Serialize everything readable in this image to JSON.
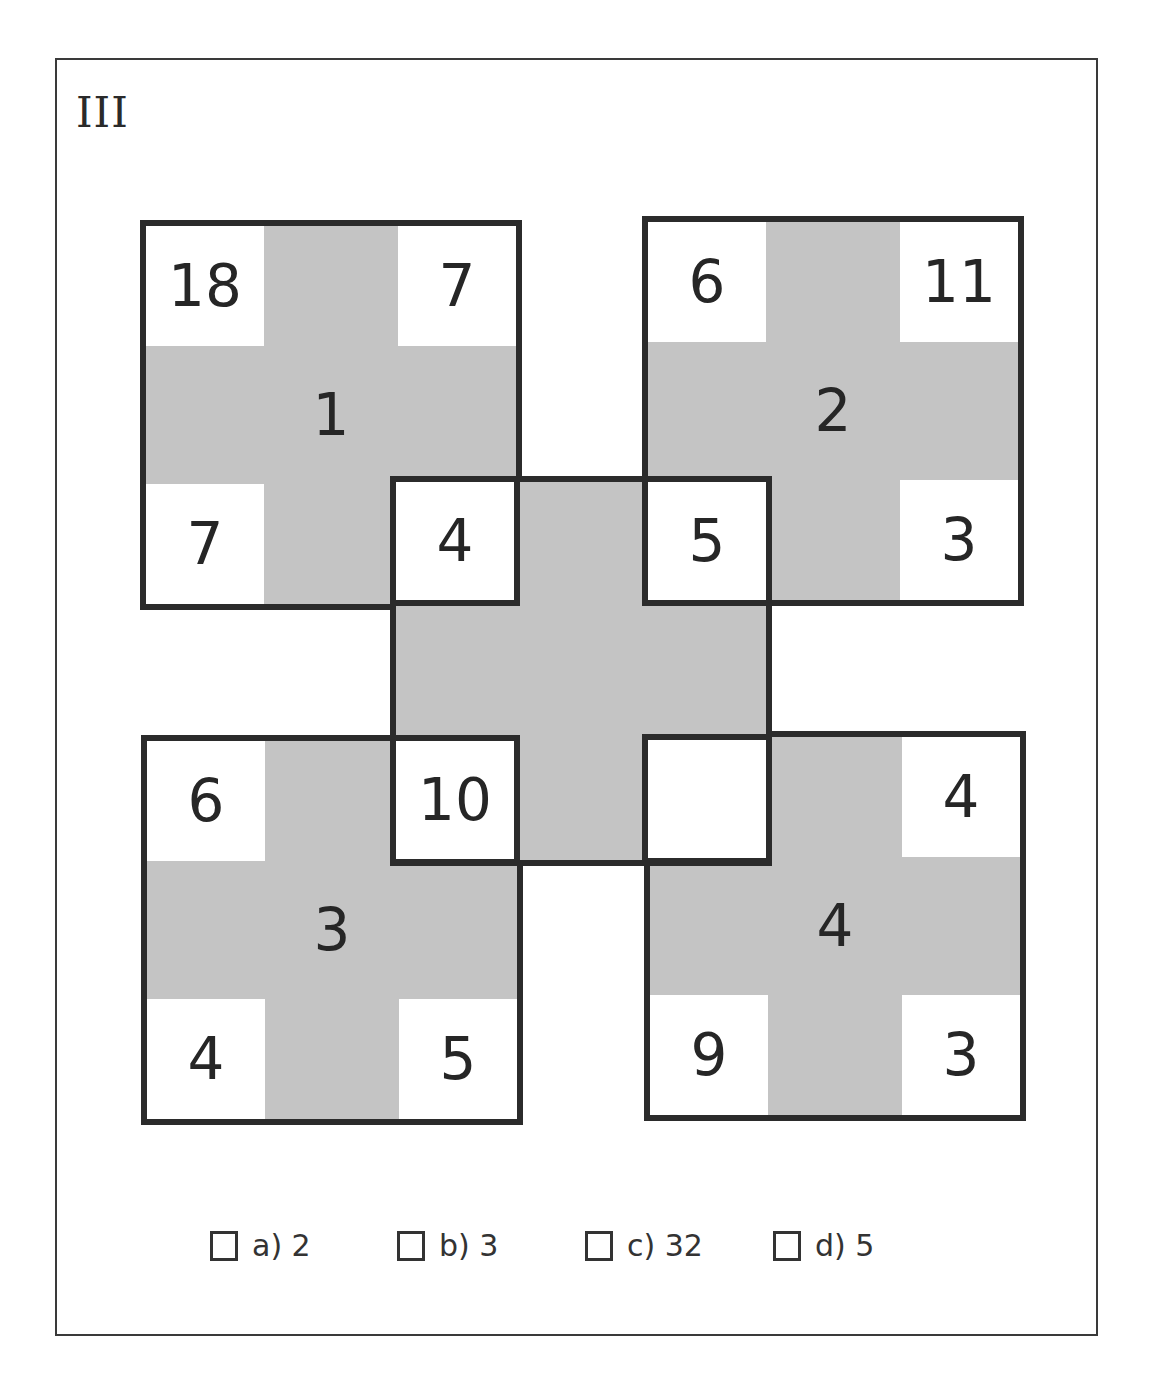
{
  "puzzle": {
    "label": "III",
    "squares": [
      {
        "id": 1,
        "center": "1",
        "top_left": "18",
        "top_right": "7",
        "bottom_left": "7",
        "bottom_right": "4"
      },
      {
        "id": 2,
        "center": "2",
        "top_left": "6",
        "top_right": "11",
        "bottom_left": "5",
        "bottom_right": "3"
      },
      {
        "id": 3,
        "center": "3",
        "top_left": "6",
        "top_right": "10",
        "bottom_left": "4",
        "bottom_right": "5"
      },
      {
        "id": 4,
        "center": "4",
        "top_left": "",
        "top_right": "4",
        "bottom_left": "9",
        "bottom_right": "3"
      }
    ],
    "center_square": {
      "top_left": "4",
      "top_right": "5",
      "bottom_left": "10",
      "bottom_right": ""
    },
    "colors": {
      "fill": "#c4c4c4",
      "border": "#2b2b2b",
      "cell": "#ffffff"
    }
  },
  "options": [
    {
      "label": "a) 2",
      "checked": false
    },
    {
      "label": "b) 3",
      "checked": false
    },
    {
      "label": "c) 32",
      "checked": false
    },
    {
      "label": "d) 5",
      "checked": false
    }
  ]
}
